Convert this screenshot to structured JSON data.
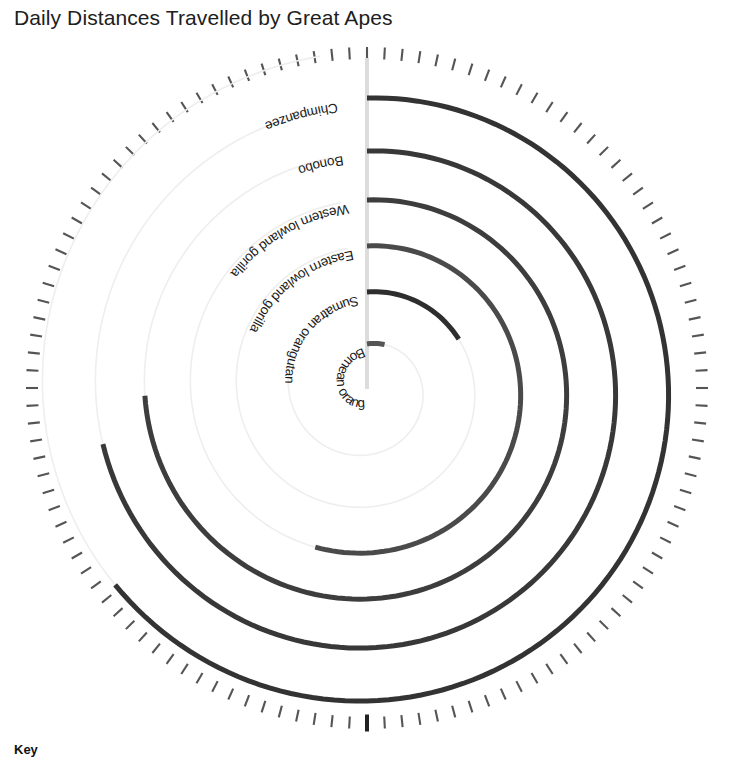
{
  "title": "Daily Distances Travelled by Great Apes",
  "key": {
    "heading": "Key"
  },
  "chart_data": {
    "type": "line",
    "variant": "spiral-polar",
    "title": "Daily Distances Travelled by Great Apes",
    "xlabel": "",
    "ylabel": "",
    "grid": true,
    "legend": "Key",
    "angle_start_deg": 0,
    "direction": "clockwise",
    "axis_line": "vertical 12 o'clock baseline",
    "outer_tick_ring": {
      "ticks": 120,
      "major_tick_at_deg": 180,
      "radius_px": 335
    },
    "categories": [
      "Chimpanzee",
      "Bonobo",
      "Western lowland gorilla",
      "Eastern lowland gorilla",
      "Sumatran orangutan",
      "Bornean orangutan"
    ],
    "series": [
      {
        "name": "Chimpanzee",
        "start_radius_px": 290,
        "sweep_deg": 232,
        "color": "#333333",
        "stroke_width": 5
      },
      {
        "name": "Bonobo",
        "start_radius_px": 237,
        "sweep_deg": 258,
        "color": "#383838",
        "stroke_width": 5
      },
      {
        "name": "Western lowland gorilla",
        "start_radius_px": 188,
        "sweep_deg": 268,
        "color": "#3d3d3d",
        "stroke_width": 5
      },
      {
        "name": "Eastern lowland gorilla",
        "start_radius_px": 142,
        "sweep_deg": 198,
        "color": "#4a4a4a",
        "stroke_width": 5
      },
      {
        "name": "Sumatran orangutan",
        "start_radius_px": 96,
        "sweep_deg": 62,
        "color": "#2e2e2e",
        "stroke_width": 5
      },
      {
        "name": "Bornean orangutan",
        "start_radius_px": 44,
        "sweep_deg": 22,
        "color": "#555555",
        "stroke_width": 5
      }
    ],
    "labels": [
      {
        "text": "Chimpanzee",
        "radius_px": 290
      },
      {
        "text": "Bonobo",
        "radius_px": 237
      },
      {
        "text": "Western lowland gorilla",
        "radius_px": 188
      },
      {
        "text": "Eastern lowland gorilla",
        "radius_px": 142
      },
      {
        "text": "Sumatran orangutan",
        "radius_px": 96
      },
      {
        "text": "Bornean orangutan",
        "radius_px": 44
      }
    ],
    "colors": {
      "axis": "#d8d8d8",
      "guide": "#eeeeee",
      "tick": "#555555",
      "major_tick": "#222222",
      "text": "#1a1a1a"
    }
  }
}
